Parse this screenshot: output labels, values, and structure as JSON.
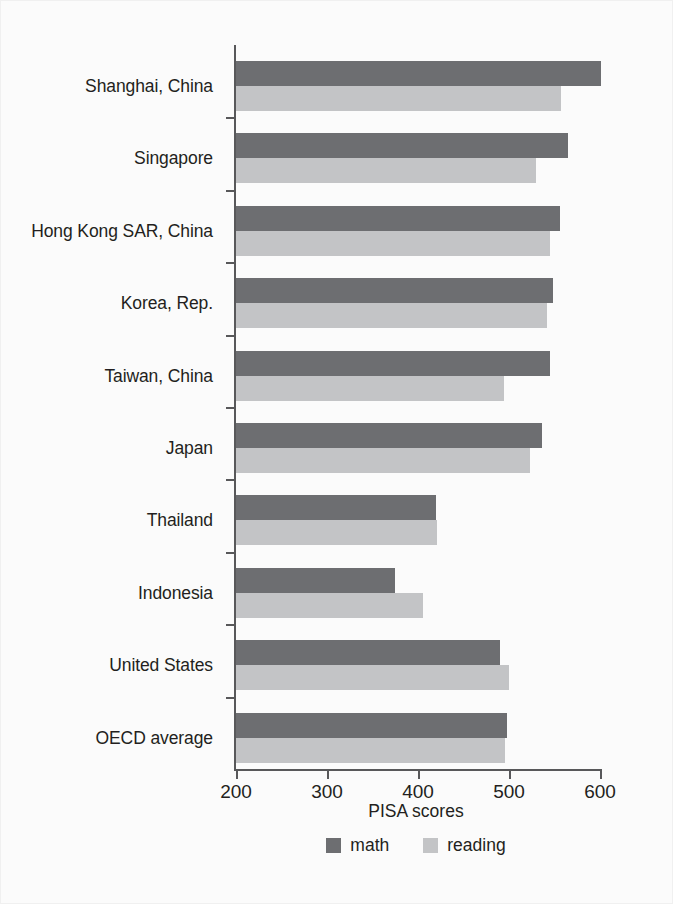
{
  "chart_data": {
    "type": "bar",
    "orientation": "horizontal",
    "title": "",
    "xlabel": "PISA scores",
    "ylabel": "",
    "xlim": [
      200,
      600
    ],
    "xticks": [
      200,
      300,
      400,
      500,
      600
    ],
    "grid": false,
    "legend_position": "bottom-center",
    "categories": [
      "Shanghai, China",
      "Singapore",
      "Hong Kong SAR, China",
      "Korea, Rep.",
      "Taiwan, China",
      "Japan",
      "Thailand",
      "Indonesia",
      "United States",
      "OECD average"
    ],
    "series": [
      {
        "name": "math",
        "color": "#6d6e71",
        "values": [
          601,
          565,
          556,
          548,
          545,
          536,
          420,
          375,
          490,
          498
        ]
      },
      {
        "name": "reading",
        "color": "#c3c4c6",
        "values": [
          557,
          530,
          545,
          542,
          495,
          523,
          421,
          406,
          500,
          496
        ]
      }
    ]
  },
  "legend": {
    "items": [
      {
        "label": "math"
      },
      {
        "label": "reading"
      }
    ]
  },
  "axis": {
    "x_title": "PISA scores",
    "tick_labels": [
      "200",
      "300",
      "400",
      "500",
      "600"
    ]
  },
  "colors": {
    "math": "#6d6e71",
    "reading": "#c3c4c6",
    "axis": "#58585a",
    "text": "#231f20",
    "background": "#fbfbfb"
  }
}
